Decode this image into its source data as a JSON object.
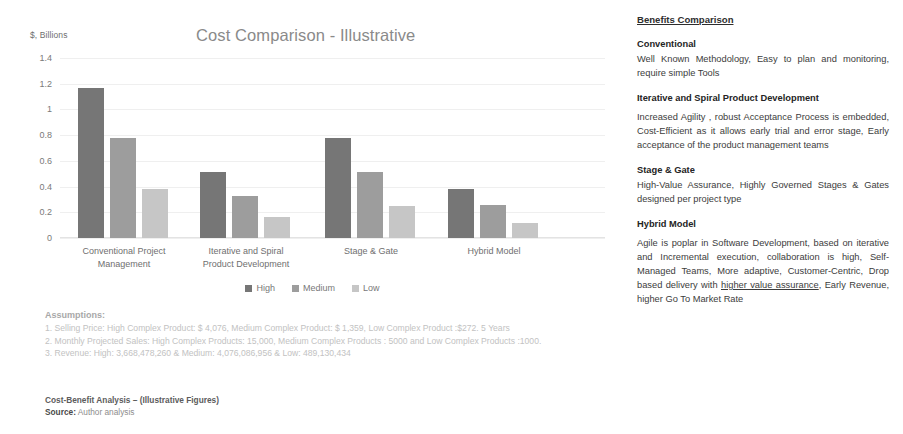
{
  "chart_data": {
    "type": "bar",
    "title": "Cost Comparison - Illustrative",
    "xlabel": "",
    "ylabel": "$, Billions",
    "ylim": [
      0,
      1.4
    ],
    "yticks": [
      "0",
      "0.2",
      "0.4",
      "0.6",
      "0.8",
      "1",
      "1.2",
      "1.4"
    ],
    "grid": true,
    "legend_position": "bottom",
    "categories": [
      "Conventional Project Management",
      "Iterative and Spiral Product Development",
      "Stage & Gate",
      "Hybrid Model"
    ],
    "category_lines": [
      [
        "Conventional Project",
        "Management"
      ],
      [
        "Iterative and Spiral",
        "Product Development"
      ],
      [
        "Stage & Gate",
        ""
      ],
      [
        "Hybrid Model",
        ""
      ]
    ],
    "series": [
      {
        "name": "High",
        "color": "#767676",
        "values": [
          1.17,
          0.51,
          0.78,
          0.385
        ]
      },
      {
        "name": "Medium",
        "color": "#9d9d9d",
        "values": [
          0.78,
          0.33,
          0.51,
          0.26
        ]
      },
      {
        "name": "Low",
        "color": "#c6c6c6",
        "values": [
          0.385,
          0.16,
          0.25,
          0.12
        ]
      }
    ]
  },
  "assumptions": {
    "title": "Assumptions:",
    "lines": [
      "1. Selling Price: High Complex Product:  $ 4,076, Medium Complex Product: $ 1,359, Low Complex Product :$272. 5 Years",
      "2. Monthly Projected Sales: High Complex Products:  15,000, Medium Complex Products : 5000 and Low Complex Products :1000.",
      "3. Revenue: High: 3,668,478,260 & Medium: 4,076,086,956 & Low: 489,130,434"
    ]
  },
  "caption": {
    "title": "Cost-Benefit Analysis – (Illustrative Figures)",
    "source_label": "Source:",
    "source_value": "Author analysis"
  },
  "benefits": {
    "heading": "Benefits Comparison",
    "blocks": [
      {
        "title": "Conventional",
        "body": "Well Known Methodology, Easy to plan and monitoring, require simple Tools"
      },
      {
        "title": "Iterative and Spiral Product Development",
        "body": "Increased Agility , robust Acceptance Process is embedded, Cost-Efficient as it allows early trial and error stage, Early acceptance of the product management teams"
      },
      {
        "title": "Stage & Gate",
        "body": "High-Value Assurance, Highly Governed Stages & Gates designed per project type"
      },
      {
        "title": "Hybrid Model",
        "body_pre": "Agile is poplar in Software Development, based on iterative and Incremental execution, collaboration is high, Self-Managed Teams, More adaptive, Customer-Centric, Drop based delivery with ",
        "body_underlined": "higher value assurance",
        "body_post": ", Early Revenue, higher Go To Market Rate"
      }
    ]
  }
}
